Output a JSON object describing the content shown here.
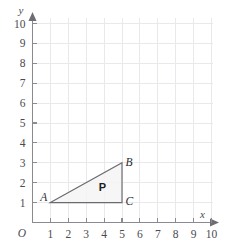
{
  "chart_data": {
    "type": "scatter",
    "title": "",
    "xlabel": "x",
    "ylabel": "y",
    "origin_label": "O",
    "grid": true,
    "xlim": [
      0,
      10
    ],
    "ylim": [
      0,
      10
    ],
    "x_ticks": [
      1,
      2,
      3,
      4,
      5,
      6,
      7,
      8,
      9,
      10
    ],
    "y_ticks": [
      1,
      2,
      3,
      4,
      5,
      6,
      7,
      8,
      9,
      10
    ],
    "x_tick_labels": [
      "1",
      "2",
      "3",
      "4",
      "5",
      "6",
      "7",
      "8",
      "9",
      "10"
    ],
    "y_tick_labels": [
      "1",
      "2",
      "3",
      "4",
      "5",
      "6",
      "7",
      "8",
      "9",
      "10"
    ],
    "legend": [],
    "annotations": [
      {
        "text": "A",
        "x": 1,
        "y": 1
      },
      {
        "text": "B",
        "x": 5,
        "y": 3
      },
      {
        "text": "C",
        "x": 5,
        "y": 1
      },
      {
        "text": "P",
        "x": 3.9,
        "y": 1.75
      }
    ],
    "shapes": [
      {
        "name": "P",
        "kind": "triangle",
        "vertices": [
          {
            "label": "A",
            "x": 1,
            "y": 1
          },
          {
            "label": "B",
            "x": 5,
            "y": 3
          },
          {
            "label": "C",
            "x": 5,
            "y": 1
          }
        ]
      }
    ]
  },
  "axes": {
    "x_name": "x",
    "y_name": "y",
    "origin": "O"
  },
  "labels": {
    "vertex_a": "A",
    "vertex_b": "B",
    "vertex_c": "C",
    "shape_p": "P"
  },
  "ticks": {
    "x": [
      "1",
      "2",
      "3",
      "4",
      "5",
      "6",
      "7",
      "8",
      "9",
      "10"
    ],
    "y": [
      "1",
      "2",
      "3",
      "4",
      "5",
      "6",
      "7",
      "8",
      "9",
      "10"
    ]
  },
  "colors": {
    "grid": "#e9e9ec",
    "axis": "#8a8a90",
    "shape_edge": "#6a6a70",
    "shape_fill": "#f4f4f6",
    "text": "#4a4a50"
  }
}
